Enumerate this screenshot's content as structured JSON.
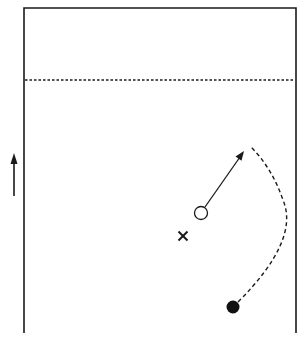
{
  "diagram": {
    "type": "court-play-diagram",
    "background": "#ffffff",
    "stroke_color": "#1a1a1a",
    "court": {
      "left": 24,
      "top": 8,
      "right": 296,
      "bottom": 333,
      "open_side": "bottom",
      "dashed_line_y": 80
    },
    "direction_arrow": {
      "x": 14,
      "y_start": 196,
      "y_end": 154,
      "direction": "up",
      "icon": "arrow-up-icon"
    },
    "players": [
      {
        "id": "open-circle",
        "kind": "open-circle-player",
        "x": 201,
        "y": 213,
        "r": 6.5
      },
      {
        "id": "filled-circle",
        "kind": "filled-circle-player",
        "x": 233,
        "y": 307,
        "r": 6.5
      },
      {
        "id": "x-marker",
        "kind": "x-player",
        "x": 183,
        "y": 236,
        "size": 4.5
      }
    ],
    "movements": [
      {
        "id": "pass-arrow",
        "style": "solid",
        "from": [
          205,
          207
        ],
        "to": [
          243,
          152
        ],
        "arrowhead": true
      },
      {
        "id": "run-path",
        "style": "dashed",
        "path": "M 238 302 Q 300 240 283 200 Q 272 168 251 147",
        "arrowhead": false
      }
    ]
  }
}
